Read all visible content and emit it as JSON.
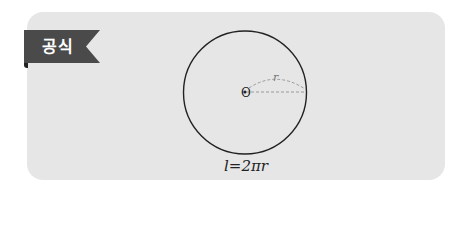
{
  "badge": {
    "label": "공식",
    "color": "#4a4a4a"
  },
  "figure": {
    "shape": "circle",
    "center_label": "O",
    "radius_label": "r",
    "stroke_color": "#222222",
    "radius_line_color": "#9a9a9a"
  },
  "formula": {
    "text": "l=2πr"
  },
  "card": {
    "background": "#e6e6e6"
  }
}
